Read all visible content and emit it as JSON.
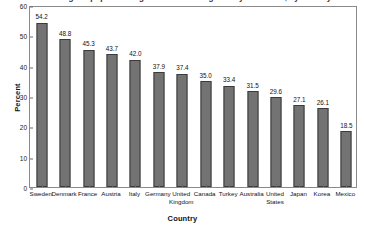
{
  "figure": {
    "title_partial": "Percentage of population aged 25-64 attaining tertiary education, by country",
    "background": "#ffffff",
    "frame_color": "#8a8a8a"
  },
  "axes": {
    "ylabel": "Percent",
    "xlabel": "Country",
    "yticks": [
      "0",
      "10",
      "20",
      "30",
      "40",
      "50",
      "60"
    ],
    "ymin": 0,
    "ymax": 60
  },
  "style": {
    "bar_fill": "#737373",
    "bar_edge": "#3b3b3b",
    "text_color": "#111111"
  },
  "chart_data": {
    "type": "bar",
    "title": "Percentage of population aged 25-64 attaining tertiary education, by country",
    "xlabel": "Country",
    "ylabel": "Percent",
    "ylim": [
      0,
      60
    ],
    "ytick_values": [
      0,
      10,
      20,
      30,
      40,
      50,
      60
    ],
    "grid": false,
    "legend": "none",
    "categories": [
      "Sweden",
      "Denmark",
      "France",
      "Austria",
      "Italy",
      "Germany",
      "United Kingdom",
      "Canada",
      "Turkey",
      "Australia",
      "United States",
      "Japan",
      "Korea",
      "Mexico"
    ],
    "values": [
      54.2,
      48.8,
      45.3,
      43.7,
      42.0,
      37.9,
      37.4,
      35.0,
      33.4,
      31.5,
      29.6,
      27.1,
      26.1,
      18.5
    ],
    "value_labels": [
      "54.2",
      "48.8",
      "45.3",
      "43.7",
      "42.0",
      "37.9",
      "37.4",
      "35.0",
      "33.4",
      "31.5",
      "29.6",
      "27.1",
      "26.1",
      "18.5"
    ]
  }
}
